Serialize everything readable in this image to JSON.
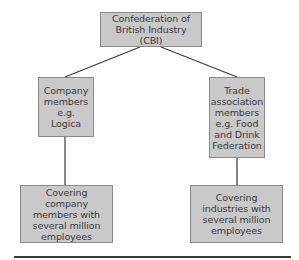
{
  "diagram": {
    "type": "hierarchy",
    "colors": {
      "box_fill": "#c9c9c9",
      "box_border": "#8a8a8a",
      "text": "#3a3a3a",
      "connector": "#3a3a3a",
      "background": "#ffffff"
    },
    "nodes": {
      "root": {
        "label": "Confederation of\nBritish Industry (CBI)"
      },
      "company_members": {
        "label": "Company\nmembers\ne.g.\nLogica"
      },
      "trade_association": {
        "label": "Trade\nassociation\nmembers\ne.g. Food\nand Drink\nFederation"
      },
      "covering_company": {
        "label": "Covering company\nmembers with\nseveral million\nemployees"
      },
      "covering_industries": {
        "label": "Covering\nindustries with\nseveral million\nemployees"
      }
    },
    "edges": [
      {
        "from": "root",
        "to": "company_members"
      },
      {
        "from": "root",
        "to": "trade_association"
      },
      {
        "from": "company_members",
        "to": "covering_company"
      },
      {
        "from": "trade_association",
        "to": "covering_industries"
      }
    ]
  }
}
